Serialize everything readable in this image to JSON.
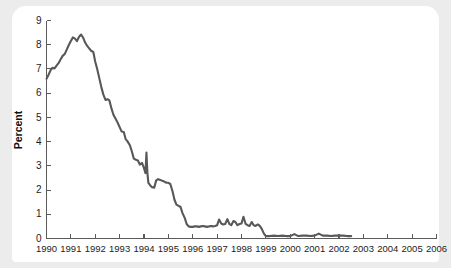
{
  "chart_data": {
    "type": "line",
    "title": "",
    "subtitle": "",
    "xlabel": "",
    "ylabel": "Percent",
    "xlim": [
      1990,
      2006
    ],
    "ylim": [
      0,
      9
    ],
    "grid": false,
    "legend": null,
    "legend_position": "none",
    "yticks": [
      0,
      1,
      2,
      3,
      4,
      5,
      6,
      7,
      8,
      9
    ],
    "ytick_labels": [
      "0",
      "1",
      "2",
      "3",
      "4",
      "5",
      "6",
      "7",
      "8",
      "9"
    ],
    "xticks": [
      1990,
      1991,
      1992,
      1993,
      1994,
      1995,
      1996,
      1997,
      1998,
      1999,
      2000,
      2001,
      2002,
      2003,
      2004,
      2005,
      2006
    ],
    "xtick_labels": [
      "1990",
      "1991",
      "1992",
      "1993",
      "1994",
      "1995",
      "1996",
      "1997",
      "1998",
      "1999",
      "2000",
      "2001",
      "2002",
      "2003",
      "2004",
      "2005",
      "2006"
    ],
    "series": [
      {
        "name": "Percent",
        "color": "#58585a",
        "x": [
          1990.0,
          1990.08,
          1990.17,
          1990.25,
          1990.33,
          1990.42,
          1990.5,
          1990.58,
          1990.67,
          1990.75,
          1990.83,
          1990.92,
          1991.0,
          1991.08,
          1991.17,
          1991.25,
          1991.33,
          1991.42,
          1991.5,
          1991.58,
          1991.67,
          1991.75,
          1991.83,
          1991.92,
          1992.0,
          1992.08,
          1992.17,
          1992.25,
          1992.33,
          1992.42,
          1992.5,
          1992.58,
          1992.67,
          1992.75,
          1992.83,
          1992.92,
          1993.0,
          1993.08,
          1993.17,
          1993.25,
          1993.33,
          1993.42,
          1993.5,
          1993.58,
          1993.67,
          1993.75,
          1993.83,
          1993.92,
          1994.0,
          1994.06,
          1994.1,
          1994.14,
          1994.18,
          1994.25,
          1994.33,
          1994.42,
          1994.5,
          1994.58,
          1994.67,
          1994.75,
          1994.83,
          1994.92,
          1995.0,
          1995.08,
          1995.17,
          1995.25,
          1995.33,
          1995.42,
          1995.5,
          1995.58,
          1995.67,
          1995.75,
          1995.83,
          1995.92,
          1996.0,
          1996.08,
          1996.17,
          1996.25,
          1996.33,
          1996.42,
          1996.5,
          1996.58,
          1996.67,
          1996.75,
          1996.83,
          1996.92,
          1997.0,
          1997.08,
          1997.17,
          1997.25,
          1997.33,
          1997.42,
          1997.5,
          1997.58,
          1997.67,
          1997.75,
          1997.83,
          1997.92,
          1998.0,
          1998.08,
          1998.17,
          1998.25,
          1998.33,
          1998.42,
          1998.5,
          1998.58,
          1998.67,
          1998.75,
          1998.83,
          1998.92,
          1999.0,
          1999.17,
          1999.33,
          1999.5,
          1999.67,
          1999.83,
          2000.0,
          2000.17,
          2000.33,
          2000.5,
          2000.67,
          2000.83,
          2001.0,
          2001.17,
          2001.33,
          2001.5,
          2001.67,
          2001.83,
          2002.0,
          2002.17,
          2002.33,
          2002.5
        ],
        "y": [
          6.6,
          6.75,
          6.95,
          7.05,
          7.02,
          7.15,
          7.25,
          7.4,
          7.55,
          7.62,
          7.8,
          8.0,
          8.15,
          8.3,
          8.25,
          8.15,
          8.32,
          8.42,
          8.3,
          8.1,
          7.95,
          7.85,
          7.75,
          7.7,
          7.3,
          7.0,
          6.6,
          6.25,
          5.95,
          5.72,
          5.75,
          5.7,
          5.35,
          5.1,
          4.95,
          4.78,
          4.6,
          4.42,
          4.4,
          4.1,
          4.0,
          3.85,
          3.6,
          3.3,
          3.25,
          3.22,
          3.05,
          3.12,
          2.9,
          2.7,
          3.55,
          2.7,
          2.3,
          2.2,
          2.12,
          2.1,
          2.4,
          2.45,
          2.42,
          2.38,
          2.35,
          2.3,
          2.3,
          2.25,
          1.95,
          1.6,
          1.4,
          1.35,
          1.3,
          1.05,
          0.85,
          0.6,
          0.5,
          0.48,
          0.48,
          0.5,
          0.5,
          0.48,
          0.5,
          0.52,
          0.5,
          0.48,
          0.5,
          0.52,
          0.5,
          0.52,
          0.55,
          0.78,
          0.62,
          0.58,
          0.6,
          0.8,
          0.6,
          0.55,
          0.72,
          0.68,
          0.55,
          0.6,
          0.62,
          0.9,
          0.6,
          0.55,
          0.52,
          0.68,
          0.55,
          0.52,
          0.58,
          0.52,
          0.4,
          0.2,
          0.1,
          0.1,
          0.12,
          0.1,
          0.12,
          0.1,
          0.1,
          0.18,
          0.1,
          0.12,
          0.12,
          0.1,
          0.12,
          0.2,
          0.12,
          0.12,
          0.1,
          0.12,
          0.12,
          0.12,
          0.1,
          0.1
        ]
      }
    ],
    "annotations": []
  },
  "colors": {
    "background": "#ececed",
    "card": "#ffffff",
    "line": "#58585a",
    "axis": "#5b5b5b",
    "text": "#1c1c1c"
  }
}
